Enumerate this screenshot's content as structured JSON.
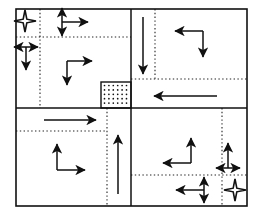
{
  "figure": {
    "type": "diagram",
    "canvas": {
      "width": 262,
      "height": 216
    },
    "colors": {
      "stroke": "#111111",
      "dotted": "#222222",
      "background": "#ffffff",
      "stipple_fill": "#ffffff"
    },
    "outer_frame": {
      "x": 16,
      "y": 9,
      "width": 231,
      "height": 197,
      "stroke_width": 1.6
    },
    "solid_dividers": [
      {
        "name": "vertical-center-divider",
        "x1": 131,
        "y1": 9,
        "x2": 131,
        "y2": 206
      },
      {
        "name": "horizontal-center-divider",
        "x1": 16,
        "y1": 108,
        "x2": 247,
        "y2": 108
      }
    ],
    "dotted_lines": [
      {
        "name": "dotted-vertical-q1",
        "x1": 40,
        "y1": 9,
        "x2": 40,
        "y2": 108
      },
      {
        "name": "dotted-horizontal-q1",
        "x1": 16,
        "y1": 37,
        "x2": 131,
        "y2": 37
      },
      {
        "name": "dotted-vertical-q2",
        "x1": 155,
        "y1": 9,
        "x2": 155,
        "y2": 79
      },
      {
        "name": "dotted-horizontal-q2",
        "x1": 131,
        "y1": 79,
        "x2": 247,
        "y2": 79
      },
      {
        "name": "dotted-vertical-q3",
        "x1": 107,
        "y1": 108,
        "x2": 107,
        "y2": 206
      },
      {
        "name": "dotted-horizontal-q3",
        "x1": 16,
        "y1": 131,
        "x2": 107,
        "y2": 131
      },
      {
        "name": "dotted-vertical-q4",
        "x1": 222,
        "y1": 108,
        "x2": 222,
        "y2": 206
      },
      {
        "name": "dotted-horizontal-q4",
        "x1": 131,
        "y1": 175,
        "x2": 247,
        "y2": 175
      }
    ],
    "stipple_box": {
      "name": "stippled-center-cell",
      "x": 101,
      "y": 82,
      "width": 30,
      "height": 26,
      "label": "refined-cell"
    },
    "arrows": [
      {
        "name": "star-marker-top-left",
        "kind": "four-point-star",
        "cx": 25,
        "cy": 21,
        "r": 11
      },
      {
        "name": "double-arrow-vertical-q1-a",
        "kind": "double-vertical",
        "cx": 62,
        "cy": 22,
        "half": 14
      },
      {
        "name": "arrow-right-q1-a",
        "kind": "single",
        "x1": 62,
        "y1": 22,
        "x2": 88,
        "y2": 22,
        "dir": "right"
      },
      {
        "name": "double-arrow-horizontal-q1-b",
        "kind": "double-horizontal",
        "cx": 26,
        "cy": 47,
        "half": 12
      },
      {
        "name": "arrow-down-q1-b",
        "kind": "single",
        "x1": 26,
        "y1": 47,
        "x2": 26,
        "y2": 70,
        "dir": "down"
      },
      {
        "name": "elbow-arrow-q1-c",
        "kind": "elbow",
        "corner_x": 67,
        "corner_y": 61,
        "arm_right_x": 92,
        "arm_down_y": 85,
        "dir": "right-down"
      },
      {
        "name": "arrow-down-q2-long",
        "kind": "single",
        "x1": 143,
        "y1": 17,
        "x2": 143,
        "y2": 74,
        "dir": "down"
      },
      {
        "name": "elbow-arrow-q2",
        "kind": "elbow",
        "corner_x": 203,
        "corner_y": 31,
        "arm_left_x": 175,
        "arm_down_y": 57,
        "dir": "left-down"
      },
      {
        "name": "arrow-left-center-long",
        "kind": "single",
        "x1": 217,
        "y1": 96,
        "x2": 154,
        "y2": 96,
        "dir": "left"
      },
      {
        "name": "arrow-right-q3-top",
        "kind": "single",
        "x1": 44,
        "y1": 120,
        "x2": 96,
        "y2": 120,
        "dir": "right"
      },
      {
        "name": "elbow-arrow-q3",
        "kind": "elbow",
        "corner_x": 57,
        "corner_y": 170,
        "arm_up_y": 144,
        "arm_right_x": 85,
        "dir": "up-right"
      },
      {
        "name": "arrow-up-center-long",
        "kind": "single",
        "x1": 118,
        "y1": 194,
        "x2": 118,
        "y2": 135,
        "dir": "up"
      },
      {
        "name": "elbow-arrow-q4",
        "kind": "elbow",
        "corner_x": 191,
        "corner_y": 163,
        "arm_up_y": 138,
        "arm_left_x": 163,
        "dir": "up-left"
      },
      {
        "name": "arrow-up-q4-right",
        "kind": "single",
        "x1": 228,
        "y1": 168,
        "x2": 228,
        "y2": 143,
        "dir": "up"
      },
      {
        "name": "double-arrow-horizontal-q4-right",
        "kind": "double-horizontal",
        "cx": 228,
        "cy": 168,
        "half": 12
      },
      {
        "name": "arrow-left-q4-bottom",
        "kind": "single",
        "x1": 204,
        "y1": 190,
        "x2": 176,
        "y2": 190,
        "dir": "left"
      },
      {
        "name": "double-arrow-vertical-q4-bottom",
        "kind": "double-vertical",
        "cx": 204,
        "cy": 190,
        "half": 13
      },
      {
        "name": "star-marker-bottom-right",
        "kind": "four-point-star",
        "cx": 235,
        "cy": 190,
        "r": 11
      }
    ]
  }
}
